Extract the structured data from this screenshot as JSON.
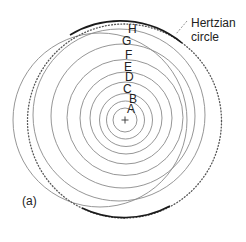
{
  "figure": {
    "panel_label": "(a)",
    "annotation": {
      "line1": "Hertzian",
      "line2": "circle"
    },
    "center_marker": "+",
    "rings": [
      {
        "label": "A",
        "cx": 125,
        "cy": 120,
        "r": 12
      },
      {
        "label": "B",
        "cx": 125.5,
        "cy": 120,
        "r": 19
      },
      {
        "label": "C",
        "cx": 126,
        "cy": 120,
        "r": 26.5
      },
      {
        "label": "D",
        "cx": 126,
        "cy": 118,
        "r": 36
      },
      {
        "label": "E",
        "cx": 126,
        "cy": 118,
        "r": 46
      },
      {
        "label": "F",
        "cx": 125,
        "cy": 117.5,
        "r": 58
      },
      {
        "label": "G",
        "cx": 123,
        "cy": 116,
        "r": 72
      },
      {
        "label": "H",
        "cx": 119,
        "cy": 115,
        "r": 86
      }
    ],
    "hertzian_circle": {
      "cx": 124.5,
      "cy": 121,
      "r": 97
    },
    "outer_ring": {
      "cx": 100,
      "cy": 120,
      "r": 87
    },
    "colors": {
      "ring": "#8a8a8a",
      "hertzian": "#1a1a1a",
      "text": "#222222"
    }
  }
}
